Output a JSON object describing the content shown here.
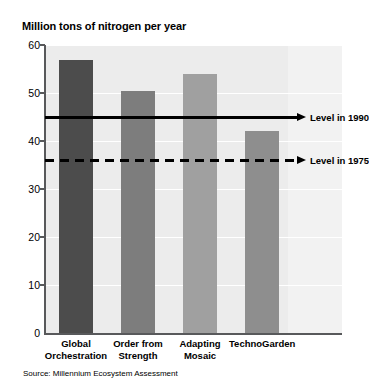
{
  "chart_data": {
    "type": "bar",
    "title": "Million tons of nitrogen per year",
    "xlabel": "",
    "ylabel": "Million tons of nitrogen per year",
    "ylim": [
      0,
      60
    ],
    "yticks": [
      0,
      10,
      20,
      30,
      40,
      50,
      60
    ],
    "ytick_labels": [
      "0",
      "10",
      "20",
      "30",
      "40",
      "50",
      "60"
    ],
    "grid": true,
    "legend_position": "right-inline",
    "categories": [
      "Global Orchestration",
      "Order from Strength",
      "Adapting Mosaic",
      "TechnoGarden"
    ],
    "category_lines": [
      [
        "Global",
        "Orchestration"
      ],
      [
        "Order from",
        "Strength"
      ],
      [
        "Adapting",
        "Mosaic"
      ],
      [
        "TechnoGarden"
      ]
    ],
    "values": [
      56.8,
      50.5,
      54.0,
      42.0
    ],
    "bar_colors": [
      "#4c4c4c",
      "#7d7d7d",
      "#a0a0a0",
      "#8e8e8e"
    ],
    "reference_lines": [
      {
        "label": "Level in 1990",
        "value": 45.0,
        "style": "solid"
      },
      {
        "label": "Level in 1975",
        "value": 36.0,
        "style": "dashed"
      }
    ],
    "annotations": [
      "Source: Millennium Ecosystem Assessment"
    ],
    "source": "Source: Millennium Ecosystem Assessment"
  },
  "colors": {
    "plot_background": "#ececec",
    "plot_background_right": "#f2f2f2",
    "axis": "#58595b",
    "gridline": "#ffffff",
    "text": "#000000"
  }
}
